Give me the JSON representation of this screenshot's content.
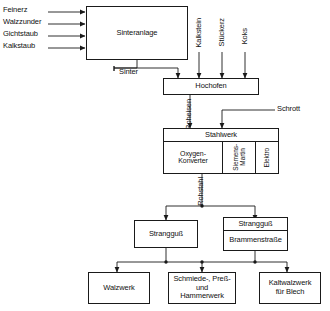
{
  "diagram": {
    "stroke_color": "#1a1a1a",
    "background_color": "#ffffff",
    "inputs": [
      {
        "label": "Feinerz"
      },
      {
        "label": "Walzzunder"
      },
      {
        "label": "Gichtstaub"
      },
      {
        "label": "Kalkstaub"
      }
    ],
    "nodes": {
      "sinteranlage": {
        "label": "Sinteranlage"
      },
      "hochofen": {
        "label": "Hochofen"
      },
      "stahlwerk": {
        "title": "Stahlwerk",
        "cells": [
          {
            "label": "Oxygen-\nKonverter"
          },
          {
            "label": "Siemens-\nMartin"
          },
          {
            "label": "Elektro"
          }
        ]
      },
      "stranggussa": {
        "label": "Strangguß"
      },
      "stranggussb": {
        "title": "Strangguß",
        "subtitle": "Brammenstraße"
      },
      "walzwerk": {
        "label": "Walzwerk"
      },
      "schmiedewerk": {
        "label": "Schmiede-, Preß-\nund\nHammerwerk"
      },
      "kaltwalzwerk": {
        "label": "Kaltwalzwerk\nfür  Blech"
      }
    },
    "flow_labels": {
      "sinter": "Sinter",
      "kalkstein": "Kalkstein",
      "stueckerz": "Stückerz",
      "koks": "Koks",
      "roheisen": "Roheisen",
      "schrott": "Schrott",
      "rohstahl": "Rohstahl"
    }
  }
}
